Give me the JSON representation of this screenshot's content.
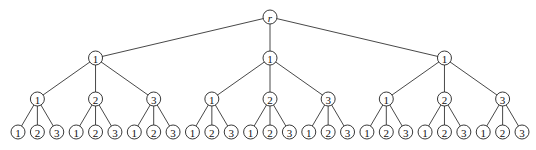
{
  "diagram": {
    "type": "tree",
    "root": {
      "label": "r",
      "children": [
        {
          "label": "1",
          "children": [
            {
              "label": "1",
              "children": [
                {
                  "label": "1"
                },
                {
                  "label": "2"
                },
                {
                  "label": "3"
                }
              ]
            },
            {
              "label": "2",
              "children": [
                {
                  "label": "1"
                },
                {
                  "label": "2"
                },
                {
                  "label": "3"
                }
              ]
            },
            {
              "label": "3",
              "children": [
                {
                  "label": "1"
                },
                {
                  "label": "2"
                },
                {
                  "label": "3"
                }
              ]
            }
          ]
        },
        {
          "label": "1",
          "children": [
            {
              "label": "1",
              "children": [
                {
                  "label": "1"
                },
                {
                  "label": "2"
                },
                {
                  "label": "3"
                }
              ]
            },
            {
              "label": "2",
              "children": [
                {
                  "label": "1"
                },
                {
                  "label": "2"
                },
                {
                  "label": "3"
                }
              ]
            },
            {
              "label": "3",
              "children": [
                {
                  "label": "1"
                },
                {
                  "label": "2"
                },
                {
                  "label": "3"
                }
              ]
            }
          ]
        },
        {
          "label": "1",
          "children": [
            {
              "label": "1",
              "children": [
                {
                  "label": "1"
                },
                {
                  "label": "2"
                },
                {
                  "label": "3"
                }
              ]
            },
            {
              "label": "2",
              "children": [
                {
                  "label": "1"
                },
                {
                  "label": "2"
                },
                {
                  "label": "3"
                }
              ]
            },
            {
              "label": "3",
              "children": [
                {
                  "label": "1"
                },
                {
                  "label": "2"
                },
                {
                  "label": "3"
                }
              ]
            }
          ]
        }
      ]
    },
    "layout": {
      "level_y": [
        17,
        58,
        99,
        132
      ],
      "leaf_x_start": 18,
      "leaf_x_end": 522,
      "node_radius": 7
    },
    "colors": {
      "line": "#333333",
      "node_fill": "#ffffff",
      "text": "#111111"
    }
  }
}
